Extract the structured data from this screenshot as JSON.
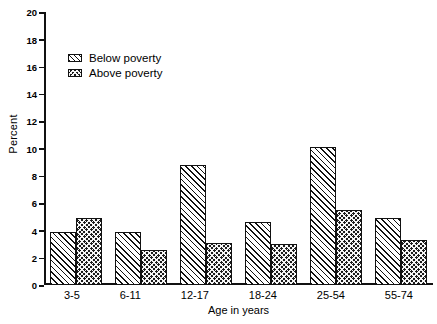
{
  "chart_data": {
    "type": "bar",
    "title": "",
    "xlabel": "Age in years",
    "ylabel": "Percent",
    "categories": [
      "3-5",
      "6-11",
      "12-17",
      "18-24",
      "25-54",
      "55-74"
    ],
    "series": [
      {
        "name": "Below poverty",
        "pattern": "diagonal-hatch",
        "values": [
          3.9,
          3.9,
          8.8,
          4.6,
          10.1,
          4.9
        ]
      },
      {
        "name": "Above poverty",
        "pattern": "dotted-crosshatch",
        "values": [
          4.9,
          2.6,
          3.1,
          3.0,
          5.5,
          3.3
        ]
      }
    ],
    "ylim": [
      0,
      20
    ],
    "yticks": [
      0,
      2,
      4,
      6,
      8,
      10,
      12,
      14,
      16,
      18,
      20
    ],
    "ytick_labels": [
      "0",
      "2",
      "4",
      "6",
      "8",
      "10",
      "12",
      "14",
      "16",
      "18",
      "20"
    ],
    "grid": false,
    "legend_position": "upper-left-inside",
    "colors": {
      "line": "#111111",
      "background": "#ffffff"
    }
  },
  "legend": {
    "items": [
      {
        "label": "Below poverty"
      },
      {
        "label": "Above poverty"
      }
    ]
  }
}
